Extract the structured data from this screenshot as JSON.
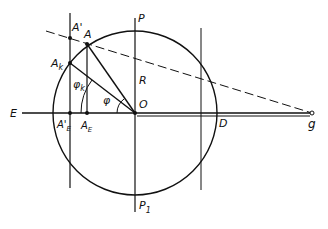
{
  "diagram": {
    "type": "geometric-construction",
    "colors": {
      "ink": "#111111",
      "background": "#ffffff"
    },
    "labels": {
      "A_prime": "A'",
      "A": "A",
      "A_k": "A",
      "A_k_sub": "k",
      "P": "P",
      "R": "R",
      "O": "O",
      "phi_k": "φ",
      "phi_k_sub": "k",
      "phi": "φ",
      "E": "E",
      "A_E_prime": "A'",
      "A_E_prime_sub": "E",
      "A_E": "A",
      "A_E_sub": "E",
      "D": "D",
      "g": "g",
      "P1": "P",
      "P1_sub": "1"
    }
  }
}
